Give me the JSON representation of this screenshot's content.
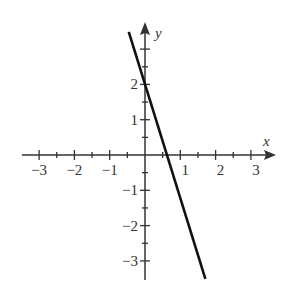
{
  "chart_data": {
    "type": "line",
    "title": "",
    "xlabel": "x",
    "ylabel": "y",
    "xlim": [
      -3.3,
      3.6
    ],
    "ylim": [
      -3.6,
      3.7
    ],
    "xticks": [
      -3,
      -2,
      -1,
      1,
      2,
      3
    ],
    "yticks": [
      -3,
      -2,
      -1,
      1,
      2
    ],
    "xtick_labels": [
      "−3",
      "−2",
      "−1",
      "1",
      "2",
      "3"
    ],
    "ytick_labels": [
      "−3",
      "−2",
      "−1",
      "1",
      "2"
    ],
    "minor_ticks_step": 0.5,
    "grid": false,
    "series": [
      {
        "name": "line",
        "equation": "y = -3x + 2",
        "x": [
          -0.46,
          1.71
        ],
        "y": [
          3.49,
          -3.51
        ],
        "y_intercept": 2,
        "x_intercept": 0.67,
        "color": "#111111"
      }
    ]
  },
  "colors": {
    "axis": "#333333",
    "line": "#111111",
    "background": "#ffffff"
  }
}
